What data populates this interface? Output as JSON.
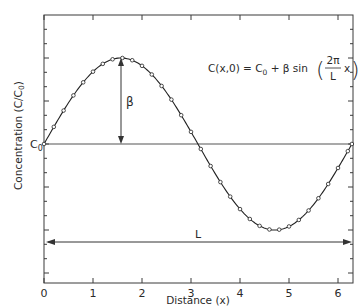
{
  "chart_data": {
    "type": "line",
    "title": "",
    "xlabel": "Distance (x)",
    "ylabel": "Concentration (C/C0)",
    "xlim": [
      0,
      6.2832
    ],
    "x_ticks": [
      0,
      1,
      2,
      3,
      4,
      5,
      6
    ],
    "x_tick_labels": [
      "0",
      "1",
      "2",
      "3",
      "4",
      "5",
      "6"
    ],
    "y_tick_labels": [
      "C0"
    ],
    "grid": false,
    "legend": null,
    "equation": "C(x,0) = C0 + β sin(2π/L · x)",
    "annotations": [
      {
        "label": "β",
        "meaning": "amplitude arrow from C0 baseline to peak at x≈π/2"
      },
      {
        "label": "L",
        "meaning": "wavelength double arrow spanning x from 0 to 2π"
      },
      {
        "label": "C0",
        "meaning": "mean concentration baseline"
      }
    ],
    "series": [
      {
        "name": "C(x,0)",
        "style": "solid line with open circle markers",
        "function": "C0 + beta*sin(x)",
        "C0": 0,
        "beta": 1,
        "x": [
          0,
          0.2,
          0.4,
          0.6,
          0.8,
          1.0,
          1.2,
          1.4,
          1.6,
          1.8,
          2.0,
          2.2,
          2.4,
          2.6,
          2.8,
          3.0,
          3.2,
          3.4,
          3.6,
          3.8,
          4.0,
          4.2,
          4.4,
          4.6,
          4.8,
          5.0,
          5.2,
          5.4,
          5.6,
          5.8,
          6.0,
          6.2,
          6.2832
        ],
        "values": [
          0,
          0.199,
          0.389,
          0.565,
          0.717,
          0.841,
          0.932,
          0.985,
          1.0,
          0.974,
          0.909,
          0.808,
          0.675,
          0.516,
          0.335,
          0.141,
          -0.058,
          -0.256,
          -0.443,
          -0.612,
          -0.757,
          -0.872,
          -0.952,
          -0.994,
          -0.996,
          -0.959,
          -0.883,
          -0.773,
          -0.631,
          -0.465,
          -0.279,
          -0.083,
          0
        ]
      }
    ]
  },
  "labels": {
    "x_axis": "Distance (x)",
    "y_axis_main": "Concentration (C/C",
    "y_axis_sub": "0",
    "y_axis_close": ")",
    "c0_main": "C",
    "c0_sub": "0",
    "beta": "β",
    "L": "L",
    "eq_left": "C(x,0) = C",
    "eq_sub": "0",
    "eq_mid": " + β sin",
    "eq_num": "2π",
    "eq_den": "L",
    "eq_x": "x",
    "x_ticks": [
      "0",
      "1",
      "2",
      "3",
      "4",
      "5",
      "6"
    ]
  },
  "colors": {
    "curve": "#222222",
    "axis": "#3a3a3a",
    "baseline": "#555555",
    "background": "#ffffff"
  }
}
